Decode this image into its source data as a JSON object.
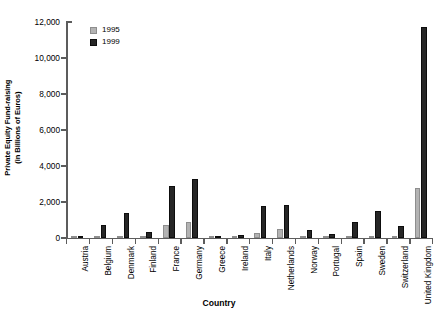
{
  "chart_data": {
    "type": "bar",
    "title": "",
    "xlabel": "Country",
    "ylabel": "Private Equity Fund-raising\n(in Billions of Euros)",
    "ylim": [
      0,
      12000
    ],
    "ytick_values": [
      0,
      2000,
      4000,
      6000,
      8000,
      10000,
      12000
    ],
    "ytick_labels": [
      "0",
      "2,000",
      "4,000",
      "6,000",
      "8,000",
      "10,000",
      "12,000"
    ],
    "grid": false,
    "legend_position": "top-left-inside",
    "categories": [
      "Austria",
      "Belgium",
      "Denmark",
      "Finland",
      "France",
      "Germany",
      "Greece",
      "Ireland",
      "Italy",
      "Netherlands",
      "Norway",
      "Portugal",
      "Spain",
      "Sweden",
      "Switzerland",
      "United Kingdom"
    ],
    "series": [
      {
        "name": "1995",
        "color": "#b3b3b3",
        "values": [
          20,
          30,
          60,
          40,
          700,
          900,
          10,
          60,
          300,
          500,
          50,
          40,
          120,
          90,
          70,
          2800
        ]
      },
      {
        "name": "1999",
        "color": "#262626",
        "values": [
          120,
          700,
          1400,
          320,
          2900,
          3300,
          60,
          180,
          1800,
          1850,
          450,
          250,
          900,
          1500,
          650,
          11700
        ]
      }
    ]
  },
  "legend": {
    "entries": [
      {
        "label": "1995",
        "swatch": "light-gray-swatch"
      },
      {
        "label": "1999",
        "swatch": "dark-swatch"
      }
    ]
  },
  "axes": {
    "y_title": "Private Equity Fund-raising\n(in Billions of Euros)",
    "x_title": "Country"
  }
}
